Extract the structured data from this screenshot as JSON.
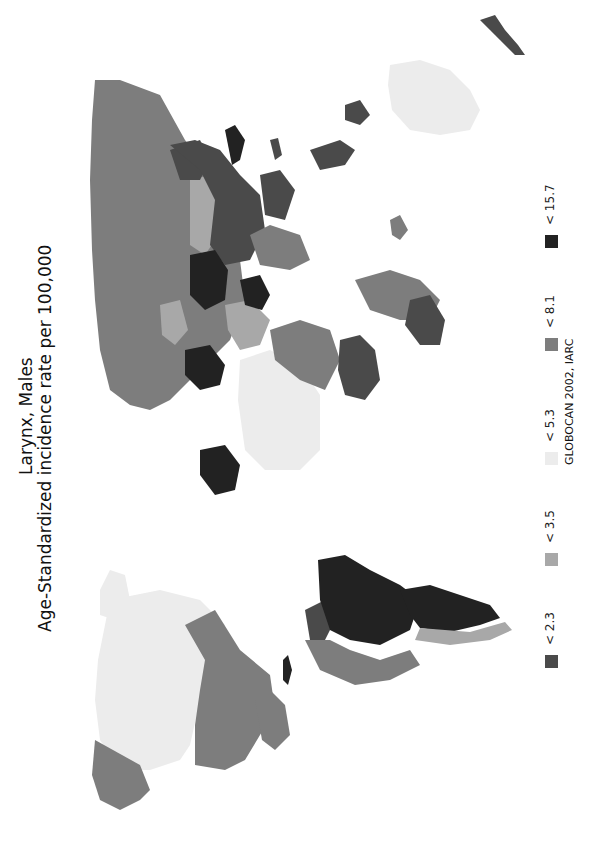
{
  "title": {
    "line1": "Larynx, Males",
    "line2": "Age-Standardized incidence rate per 100,000"
  },
  "source": "GLOBOCAN 2002, IARC",
  "orientation": "rotated 90° counter-clockwise (north at left)",
  "legend": [
    {
      "label": "< 2.3",
      "color": "#4a4a4a"
    },
    {
      "label": "< 3.5",
      "color": "#a8a8a8"
    },
    {
      "label": "< 5.3",
      "color": "#ececec"
    },
    {
      "label": "< 8.1",
      "color": "#7d7d7d"
    },
    {
      "label": "< 15.7",
      "color": "#222222"
    }
  ],
  "regions": [
    {
      "name": "canada",
      "class": "< 5.3"
    },
    {
      "name": "alaska",
      "class": "< 8.1"
    },
    {
      "name": "usa",
      "class": "< 8.1"
    },
    {
      "name": "greenland",
      "class": "< 5.3"
    },
    {
      "name": "mexico-central-america",
      "class": "< 8.1"
    },
    {
      "name": "cuba",
      "class": "< 15.7"
    },
    {
      "name": "brazil",
      "class": "< 15.7"
    },
    {
      "name": "argentina",
      "class": "< 15.7"
    },
    {
      "name": "andean-south-america",
      "class": "< 8.1"
    },
    {
      "name": "colombia-venezuela",
      "class": "< 2.3"
    },
    {
      "name": "south-america-south-coast",
      "class": "< 3.5"
    },
    {
      "name": "russia",
      "class": "< 8.1"
    },
    {
      "name": "kazakhstan",
      "class": "< 3.5"
    },
    {
      "name": "china",
      "class": "< 2.3"
    },
    {
      "name": "mongolia",
      "class": "< 2.3"
    },
    {
      "name": "japan-korea",
      "class": "< 15.7"
    },
    {
      "name": "india",
      "class": "< 8.1"
    },
    {
      "name": "southeast-asia",
      "class": "< 2.3"
    },
    {
      "name": "indonesia",
      "class": "< 2.3"
    },
    {
      "name": "eastern-europe",
      "class": "< 15.7"
    },
    {
      "name": "western-europe",
      "class": "< 15.7"
    },
    {
      "name": "scandinavia",
      "class": "< 3.5"
    },
    {
      "name": "iberia",
      "class": "< 15.7"
    },
    {
      "name": "middle-east",
      "class": "< 3.5"
    },
    {
      "name": "iran",
      "class": "< 15.7"
    },
    {
      "name": "north-africa",
      "class": "< 5.3"
    },
    {
      "name": "west-africa",
      "class": "< 8.1"
    },
    {
      "name": "central-africa",
      "class": "< 2.3"
    },
    {
      "name": "east-africa",
      "class": "< 8.1"
    },
    {
      "name": "southern-africa",
      "class": "< 2.3"
    },
    {
      "name": "madagascar",
      "class": "< 8.1"
    },
    {
      "name": "australia",
      "class": "< 5.3"
    },
    {
      "name": "new-zealand",
      "class": "< 2.3"
    },
    {
      "name": "papua-new-guinea",
      "class": "< 2.3"
    },
    {
      "name": "philippines",
      "class": "< 2.3"
    }
  ]
}
